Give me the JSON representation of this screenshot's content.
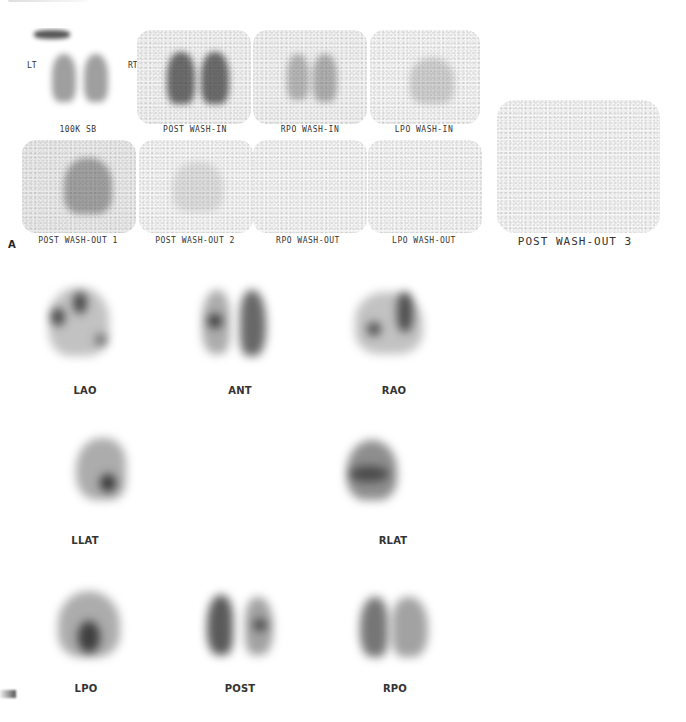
{
  "figure": {
    "heading_fragment": "",
    "panel_a": {
      "letter": "A",
      "orientation_labels": {
        "left": "LT",
        "right": "RT"
      },
      "frames": [
        {
          "id": "100k-sb",
          "label": "100K SB"
        },
        {
          "id": "post-wash-in",
          "label": "POST WASH-IN"
        },
        {
          "id": "rpo-wash-in",
          "label": "RPO WASH-IN"
        },
        {
          "id": "lpo-wash-in",
          "label": "LPO WASH-IN"
        },
        {
          "id": "post-wash-out-1",
          "label": "POST WASH-OUT 1"
        },
        {
          "id": "post-wash-out-2",
          "label": "POST WASH-OUT 2"
        },
        {
          "id": "rpo-wash-out",
          "label": "RPO WASH-OUT"
        },
        {
          "id": "lpo-wash-out",
          "label": "LPO WASH-OUT"
        },
        {
          "id": "post-wash-out-3",
          "label": "POST WASH-OUT 3"
        }
      ]
    },
    "panel_b": {
      "letter": "B",
      "views": [
        {
          "id": "lao",
          "label": "LAO"
        },
        {
          "id": "ant",
          "label": "ANT"
        },
        {
          "id": "rao",
          "label": "RAO"
        },
        {
          "id": "llat",
          "label": "LLAT"
        },
        {
          "id": "rlat",
          "label": "RLAT"
        },
        {
          "id": "lpo",
          "label": "LPO"
        },
        {
          "id": "post",
          "label": "POST"
        },
        {
          "id": "rpo",
          "label": "RPO"
        }
      ]
    }
  }
}
